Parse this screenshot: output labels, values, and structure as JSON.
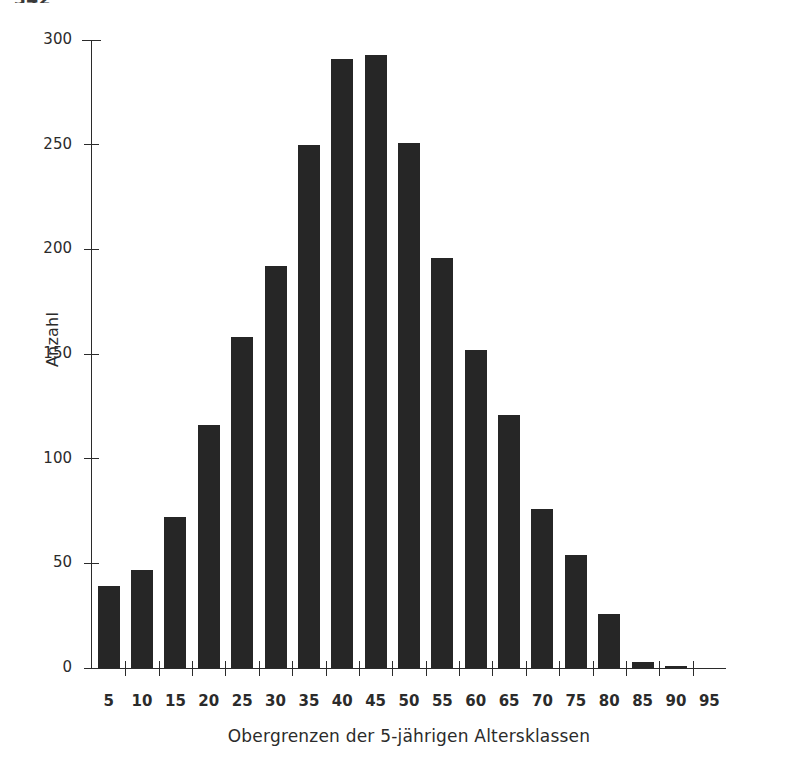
{
  "page": {
    "number": "342"
  },
  "chart_data": {
    "type": "bar",
    "title": "",
    "subtitle": "",
    "xlabel": "Obergrenzen der 5-jährigen Altersklassen",
    "ylabel": "Anzahl",
    "categories": [
      "5",
      "10",
      "15",
      "20",
      "25",
      "30",
      "35",
      "40",
      "45",
      "50",
      "55",
      "60",
      "65",
      "70",
      "75",
      "80",
      "85",
      "90",
      "95"
    ],
    "values": [
      39,
      47,
      72,
      116,
      158,
      192,
      250,
      291,
      293,
      251,
      196,
      152,
      121,
      76,
      54,
      26,
      3,
      1,
      0
    ],
    "xlim": [
      0,
      19
    ],
    "ylim": [
      0,
      300
    ],
    "yticks": [
      0,
      50,
      100,
      150,
      200,
      250,
      300
    ],
    "ytick_labels": [
      "0",
      "50",
      "100",
      "150",
      "200",
      "250",
      "300"
    ],
    "xtick_labels": [
      "5",
      "10",
      "15",
      "20",
      "25",
      "30",
      "35",
      "40",
      "45",
      "50",
      "55",
      "60",
      "65",
      "70",
      "75",
      "80",
      "85",
      "90",
      "95"
    ],
    "grid": false,
    "legend": null,
    "bar_color": "#262626",
    "axis_color": "#2b2b2b",
    "background": "#ffffff"
  }
}
